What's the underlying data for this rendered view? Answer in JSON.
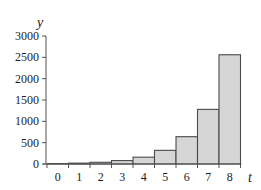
{
  "chart_data": {
    "type": "bar",
    "title": "",
    "xlabel": "t",
    "ylabel": "y",
    "categories": [
      "0",
      "1",
      "2",
      "3",
      "4",
      "5",
      "6",
      "7",
      "8"
    ],
    "values": [
      10,
      20,
      40,
      80,
      160,
      320,
      640,
      1280,
      2560
    ],
    "ylim": [
      0,
      3000
    ],
    "yticks": [
      0,
      500,
      1000,
      1500,
      2000,
      2500,
      3000
    ],
    "grid": false,
    "legend": null,
    "bar_fill": "#d6d6d6",
    "bar_stroke": "#4a4a4a"
  }
}
